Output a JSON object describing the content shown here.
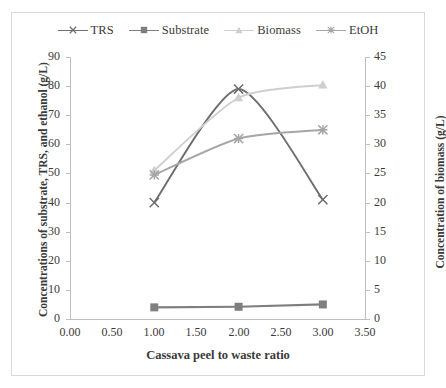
{
  "chart_data": {
    "type": "line",
    "title": "",
    "xlabel": "Cassava peel to waste ratio",
    "ylabel": "Concentrations of substrate, TRS, and ethanol (g/L)",
    "y2label": "Concentration of biomass (g/L)",
    "x": [
      1.0,
      2.0,
      3.0
    ],
    "xlim": [
      0.0,
      3.5
    ],
    "ylim": [
      0,
      90
    ],
    "y2lim": [
      0,
      45
    ],
    "grid": false,
    "legend_position": "top-center",
    "xticks": [
      "0.00",
      "0.50",
      "1.00",
      "1.50",
      "2.00",
      "2.50",
      "3.00",
      "3.50"
    ],
    "xtick_values": [
      0.0,
      0.5,
      1.0,
      1.5,
      2.0,
      2.5,
      3.0,
      3.5
    ],
    "yticks": [
      "0",
      "10",
      "20",
      "30",
      "40",
      "50",
      "60",
      "70",
      "80",
      "90"
    ],
    "ytick_values": [
      0,
      10,
      20,
      30,
      40,
      50,
      60,
      70,
      80,
      90
    ],
    "y2ticks": [
      "0",
      "5",
      "10",
      "15",
      "20",
      "25",
      "30",
      "35",
      "40",
      "45"
    ],
    "y2tick_values": [
      0,
      5,
      10,
      15,
      20,
      25,
      30,
      35,
      40,
      45
    ],
    "series": [
      {
        "name": "TRS",
        "axis": "left",
        "marker": "x",
        "color": "#6e6e6e",
        "smooth": true,
        "values": [
          40,
          79,
          41
        ]
      },
      {
        "name": "Substrate",
        "axis": "left",
        "marker": "square",
        "color": "#7f7f7f",
        "smooth": false,
        "values": [
          4.0,
          4.2,
          5.0
        ]
      },
      {
        "name": "Biomass",
        "axis": "right",
        "marker": "triangle",
        "color": "#cfcfcf",
        "smooth": true,
        "values": [
          25.5,
          38.0,
          40.2
        ]
      },
      {
        "name": "EtOH",
        "axis": "left",
        "marker": "x",
        "color": "#a6a6a6",
        "smooth": true,
        "values": [
          49.5,
          62.0,
          65.0
        ]
      }
    ]
  },
  "legend": {
    "items": [
      {
        "label": "TRS"
      },
      {
        "label": "Substrate"
      },
      {
        "label": "Biomass"
      },
      {
        "label": "EtOH"
      }
    ]
  },
  "axes": {
    "x_title": "Cassava peel to waste ratio",
    "y_left_title": "Concentrations of substrate, TRS, and ethanol (g/L)",
    "y_right_title": "Concentration of biomass (g/L)"
  },
  "colors": {
    "trs": "#6e6e6e",
    "substrate": "#7f7f7f",
    "biomass": "#cfcfcf",
    "etoh": "#a6a6a6",
    "axis": "#bfbfbf",
    "frame": "#d9d9d9",
    "text": "#3a3a3a"
  }
}
